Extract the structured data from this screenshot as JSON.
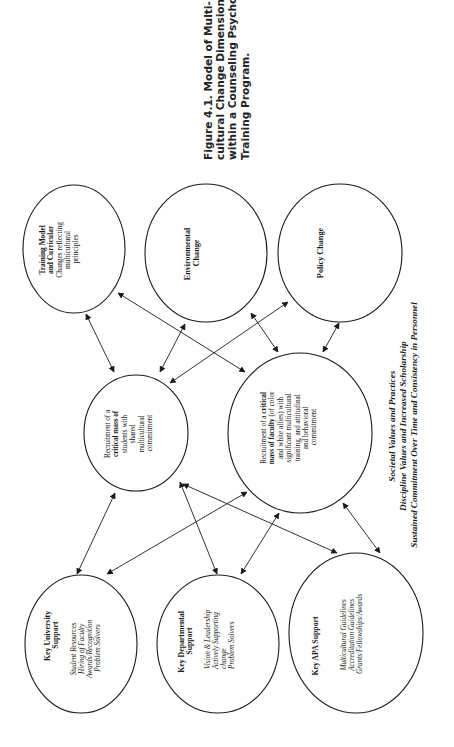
{
  "figure": {
    "caption_lines": [
      "Figure  4.1.   Model  of  Multi-",
      "cultural  Change  Dimensions",
      "within a Counseling Psychology",
      "Training Program."
    ]
  },
  "nodes": {
    "training_model": {
      "lines": [
        "Training Model",
        "and Curricular",
        "Changes reflecting",
        "multicultural",
        "principles"
      ]
    },
    "environmental_change": {
      "lines": [
        "Environmental",
        "Change"
      ]
    },
    "policy_change": {
      "lines": [
        "Policy Change"
      ]
    },
    "students": {
      "lines": [
        "Recruitment of a",
        "critical mass of",
        "students with",
        "shared",
        "multicultural",
        "commitment"
      ]
    },
    "faculty": {
      "line1a": "Recruitment of a ",
      "line1b": "critical",
      "line2a": "mass of faculty",
      "line2b": " (of color",
      "lines": [
        "and white allies) with",
        "significant multicultural",
        "training, and attitudinal",
        "and behavioral",
        "commitment"
      ]
    },
    "key_university": {
      "title": [
        "Key University",
        "Support"
      ],
      "items": [
        "Student Resources",
        "Hiring of Faculty",
        "Awards/Recognition",
        "Problem Solvers"
      ]
    },
    "key_departmental": {
      "title": [
        "Key Departmental",
        "Support"
      ],
      "items": [
        "Vision & Leadership",
        "Actively Supporting",
        "change",
        "Problem Solvers"
      ]
    },
    "key_apa": {
      "title": [
        "Key APA Support"
      ],
      "items": [
        "Multicultural Guidelines",
        "Accreditation Guidelines",
        "Grants/Fellowships/Awards"
      ]
    }
  },
  "context_text": [
    "Societal Values and Practices",
    "Discipline Values and Increased Scholarship",
    "Sustained Commitment Over Time and Consistency in Personnel"
  ],
  "connections": [
    {
      "from": "training_model",
      "to": "students",
      "type": "bidirectional"
    },
    {
      "from": "training_model",
      "to": "faculty",
      "type": "bidirectional"
    },
    {
      "from": "environmental_change",
      "to": "students",
      "type": "bidirectional"
    },
    {
      "from": "policy_change",
      "to": "students",
      "type": "bidirectional"
    },
    {
      "from": "environmental_change",
      "to": "faculty",
      "type": "bidirectional"
    },
    {
      "from": "policy_change",
      "to": "faculty",
      "type": "bidirectional"
    },
    {
      "from": "students",
      "to": "key_university",
      "type": "bidirectional"
    },
    {
      "from": "faculty",
      "to": "key_university",
      "type": "bidirectional"
    },
    {
      "from": "students",
      "to": "key_departmental",
      "type": "bidirectional"
    },
    {
      "from": "students",
      "to": "key_apa",
      "type": "bidirectional"
    },
    {
      "from": "faculty",
      "to": "key_departmental",
      "type": "bidirectional"
    },
    {
      "from": "faculty",
      "to": "key_apa",
      "type": "bidirectional"
    }
  ],
  "colors": {
    "ink": "#1a1a1a",
    "background": "#ffffff"
  }
}
